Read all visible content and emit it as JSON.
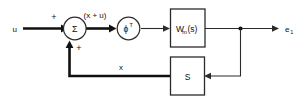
{
  "diagram": {
    "type": "control-system-block-diagram",
    "title": "",
    "background_color": "#ffffff",
    "line_color": "#2b2b2b",
    "text_color": "#111111",
    "signals": {
      "input": "u",
      "sum_output": "(x + u)",
      "output": "e",
      "output_subscript": "1",
      "feedback": "x"
    },
    "signs": {
      "top": "+",
      "bottom": "+"
    },
    "blocks": [
      {
        "id": "summing-junction",
        "shape": "circle",
        "label": "Σ"
      },
      {
        "id": "phi-transpose",
        "shape": "circle",
        "label": "ϕ",
        "superscript": "T"
      },
      {
        "id": "wm-block",
        "shape": "rectangle",
        "label": "W",
        "subscript": "m",
        "label_tail": "(s)"
      },
      {
        "id": "s-block",
        "shape": "rectangle",
        "label": "S"
      }
    ]
  }
}
